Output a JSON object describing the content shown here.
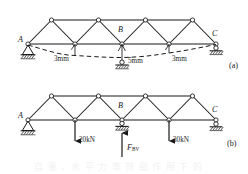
{
  "figure": {
    "title_hidden": "",
    "panels": [
      {
        "id": "a",
        "caption": "(a)",
        "nodes": {
          "left_support": "A",
          "mid_support": "B",
          "right_support": "C"
        },
        "settlements": [
          {
            "label": "3mm",
            "value": 3,
            "unit": "mm",
            "position": "left-quarter"
          },
          {
            "label": "5mm",
            "value": 5,
            "unit": "mm",
            "position": "midspan"
          },
          {
            "label": "3mm",
            "value": 3,
            "unit": "mm",
            "position": "right-quarter"
          }
        ],
        "supports": [
          {
            "node": "A",
            "type": "pin"
          },
          {
            "node": "B",
            "type": "roller-on-ground"
          },
          {
            "node": "C",
            "type": "roller"
          }
        ],
        "deflected_shape": "dashed-sagging-curve"
      },
      {
        "id": "b",
        "caption": "(b)",
        "nodes": {
          "left_support": "A",
          "mid_support": "B",
          "right_support": "C"
        },
        "loads": [
          {
            "label": "20kN",
            "value": 20,
            "unit": "kN",
            "direction": "down",
            "position": "left-quarter"
          },
          {
            "label": "30kN",
            "value": 30,
            "unit": "kN",
            "direction": "down",
            "position": "right-quarter"
          }
        ],
        "reactions": [
          {
            "symbol": "F",
            "subscript": "BV",
            "direction": "up",
            "position": "midspan"
          }
        ],
        "supports": [
          {
            "node": "A",
            "type": "pin"
          },
          {
            "node": "B",
            "type": "roller-on-ground"
          },
          {
            "node": "C",
            "type": "roller"
          }
        ]
      }
    ],
    "colors": {
      "line": "#1a1a1a",
      "background": "#ffffff",
      "node_fill": "#ffffff",
      "hatch": "#2b2b2b"
    },
    "ghost_text": "自 重 、水 平 力 等 荷 载 作 用 下 的"
  }
}
